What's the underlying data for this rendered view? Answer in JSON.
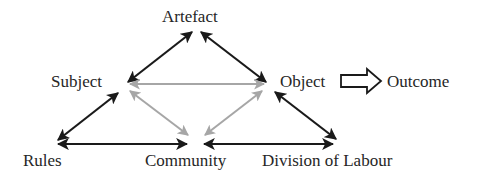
{
  "diagram": {
    "type": "activity-system-triangle",
    "nodes": {
      "artefact": "Artefact",
      "subject": "Subject",
      "object": "Object",
      "outcome": "Outcome",
      "rules": "Rules",
      "community": "Community",
      "division_of_labour": "Division of Labour"
    },
    "edges": [
      {
        "from": "Subject",
        "to": "Artefact",
        "style": "black-double-arrow"
      },
      {
        "from": "Artefact",
        "to": "Object",
        "style": "black-double-arrow"
      },
      {
        "from": "Subject",
        "to": "Object",
        "style": "gray-double-arrow"
      },
      {
        "from": "Subject",
        "to": "Community",
        "style": "gray-double-arrow"
      },
      {
        "from": "Object",
        "to": "Community",
        "style": "gray-double-arrow"
      },
      {
        "from": "Subject",
        "to": "Rules",
        "style": "black-double-arrow"
      },
      {
        "from": "Rules",
        "to": "Community",
        "style": "black-double-arrow"
      },
      {
        "from": "Community",
        "to": "Division of Labour",
        "style": "black-double-arrow"
      },
      {
        "from": "Object",
        "to": "Division of Labour",
        "style": "black-double-arrow"
      },
      {
        "from": "Object",
        "to": "Outcome",
        "style": "hollow-block-arrow"
      }
    ],
    "colors": {
      "black_arrow": "#1a1a1a",
      "gray_arrow": "#a6a6a6",
      "text": "#262626"
    }
  }
}
